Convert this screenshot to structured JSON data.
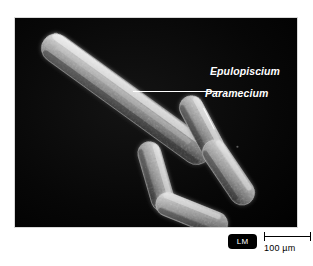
{
  "figure": {
    "type": "light-micrograph",
    "background_color": "#ffffff",
    "panel_background_color": "#000000",
    "panel_border_color": "#d8d8d8"
  },
  "photo": {
    "alt_description": "Light micrograph showing one very large cigar-shaped Epulopiscium bacterium alongside four smaller Paramecium protist cells on a black background",
    "cell_color": "#b9b9b9",
    "cell_highlight_color": "#e8e8e8",
    "cell_shadow_color": "#4a4a4a"
  },
  "labels": {
    "epulopiscium": "Epulopiscium",
    "paramecium": "Paramecium",
    "label_color": "#ffffff",
    "leader_color": "#ffffff"
  },
  "caption": {
    "microscopy_badge": "LM",
    "badge_background_color": "#000000",
    "badge_text_color": "#ffffff",
    "scale_value": "100 µm",
    "scale_bar_color": "#000000"
  },
  "organisms": [
    {
      "name": "Epulopiscium",
      "kind": "bacterium",
      "count": 1,
      "description": "very long slender rod oriented diagonally from upper-left to lower-right"
    },
    {
      "name": "Paramecium",
      "kind": "protist",
      "count": 4,
      "description": "smaller cigar-shaped ciliate cells clustered lower-center and lower-right"
    }
  ]
}
